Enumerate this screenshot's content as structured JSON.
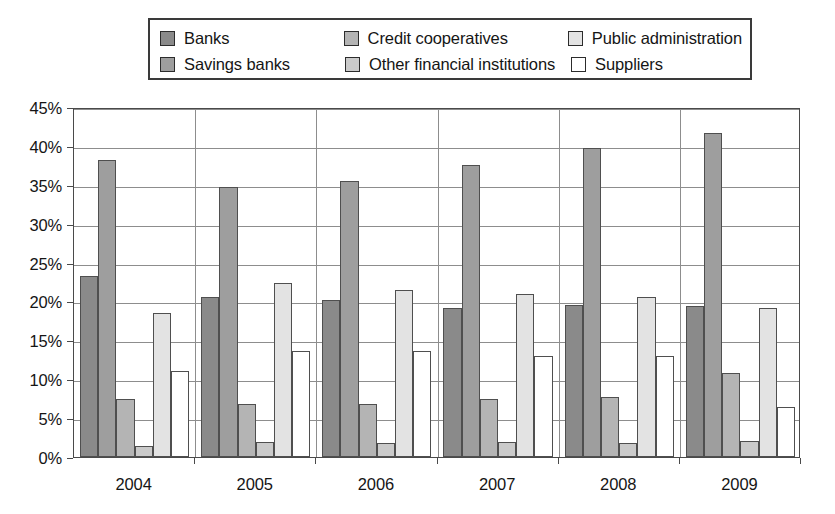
{
  "chart_data": {
    "type": "bar",
    "title": "",
    "subtitle": "",
    "xlabel": "",
    "ylabel": "",
    "categories": [
      "2004",
      "2005",
      "2006",
      "2007",
      "2008",
      "2009"
    ],
    "ylim": [
      0,
      45
    ],
    "ytick_step": 5,
    "ytick_labels": [
      "0%",
      "5%",
      "10%",
      "15%",
      "20%",
      "25%",
      "30%",
      "35%",
      "40%",
      "45%"
    ],
    "ytick_values": [
      0,
      5,
      10,
      15,
      20,
      25,
      30,
      35,
      40,
      45
    ],
    "value_unit": "%",
    "grid": "horizontal",
    "legend_position": "top",
    "legend_columns": 3,
    "legend_rows": 2,
    "series": [
      {
        "name": "Banks",
        "color": "#8a8a8a",
        "values": [
          23.3,
          20.6,
          20.2,
          19.2,
          19.6,
          19.4
        ]
      },
      {
        "name": "Savings banks",
        "color": "#9e9e9e",
        "values": [
          38.2,
          34.7,
          35.5,
          37.6,
          39.7,
          41.6
        ]
      },
      {
        "name": "Credit cooperatives",
        "color": "#b4b4b4",
        "values": [
          7.5,
          6.8,
          6.8,
          7.4,
          7.7,
          10.8
        ]
      },
      {
        "name": "Other financial institutions",
        "color": "#cacaca",
        "values": [
          1.4,
          1.9,
          1.8,
          1.9,
          1.8,
          2.1
        ]
      },
      {
        "name": "Public administration",
        "color": "#e3e3e3",
        "values": [
          18.5,
          22.4,
          21.5,
          20.9,
          20.6,
          19.2
        ]
      },
      {
        "name": "Suppliers",
        "color": "#ffffff",
        "values": [
          11.1,
          13.6,
          13.6,
          13.0,
          13.0,
          6.4
        ]
      }
    ]
  },
  "legend": {
    "items": [
      {
        "label": "Banks",
        "color": "#8a8a8a"
      },
      {
        "label": "Credit cooperatives",
        "color": "#b4b4b4"
      },
      {
        "label": "Public administration",
        "color": "#e3e3e3"
      },
      {
        "label": "Savings banks",
        "color": "#9e9e9e"
      },
      {
        "label": "Other financial institutions",
        "color": "#cacaca"
      },
      {
        "label": "Suppliers",
        "color": "#ffffff"
      }
    ]
  },
  "axes": {
    "y_ticks": [
      "45%",
      "40%",
      "35%",
      "30%",
      "25%",
      "20%",
      "15%",
      "10%",
      "5%",
      "0%"
    ],
    "x_ticks": [
      "2004",
      "2005",
      "2006",
      "2007",
      "2008",
      "2009"
    ]
  }
}
